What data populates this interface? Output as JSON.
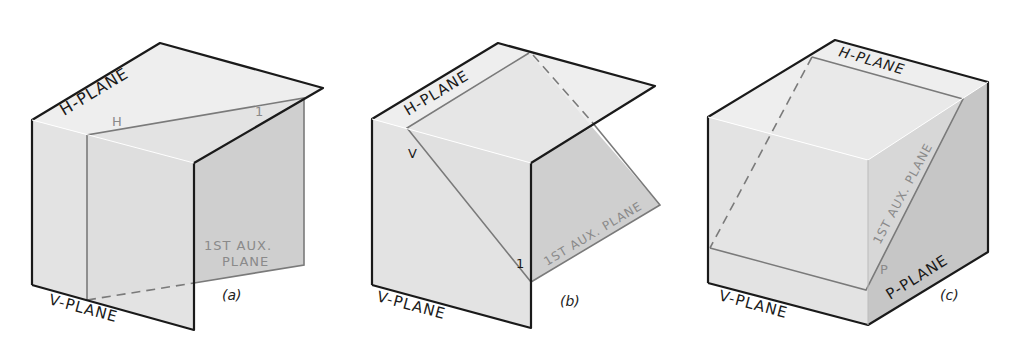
{
  "figure_a": {
    "caption": "(a)",
    "h_plane_label": "H-PLANE",
    "v_plane_label": "V-PLANE",
    "aux_plane_label_line1": "1ST AUX.",
    "aux_plane_label_line2": "PLANE",
    "fold_label_h": "H",
    "fold_label_1": "1"
  },
  "figure_b": {
    "caption": "(b)",
    "h_plane_label": "H-PLANE",
    "v_plane_label": "V-PLANE",
    "aux_plane_label": "1ST AUX. PLANE",
    "fold_label_v": "V",
    "fold_label_1": "1"
  },
  "figure_c": {
    "caption": "(c)",
    "h_plane_label": "H-PLANE",
    "v_plane_label": "V-PLANE",
    "p_plane_label": "P-PLANE",
    "aux_plane_label": "1ST AUX. PLANE",
    "fold_label_p": "P",
    "fold_label_1": "1"
  },
  "colors": {
    "top_face": "#ececec",
    "front_face": "#e0e0e0",
    "side_face": "#c6c6c6",
    "aux_plane": "#d2d2d2",
    "outline": "#1a1a1a",
    "aux_line": "#7a7a7a"
  }
}
